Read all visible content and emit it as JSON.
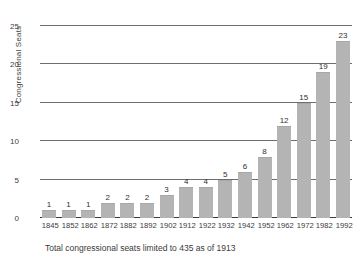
{
  "chart_data": {
    "type": "bar",
    "title": "",
    "subtitle": "",
    "xlabel": "",
    "ylabel": "Congressional Seats",
    "categories": [
      "1845",
      "1852",
      "1862",
      "1872",
      "1882",
      "1892",
      "1902",
      "1912",
      "1922",
      "1932",
      "1942",
      "1952",
      "1962",
      "1972",
      "1982",
      "1992"
    ],
    "values": [
      1,
      1,
      1,
      2,
      2,
      2,
      3,
      4,
      4,
      5,
      6,
      8,
      12,
      15,
      19,
      23
    ],
    "ylim": [
      0,
      25
    ],
    "y_ticks": [
      0,
      5,
      10,
      15,
      20,
      25
    ],
    "y_tick_labels": [
      "0",
      "5",
      "10",
      "15",
      "20",
      "25"
    ],
    "grid": true,
    "legend": null,
    "annotations": [
      "Total congressional seats limited to 435 as of 1913"
    ],
    "bar_color": "#b4b4b4",
    "show_value_labels": true
  },
  "caption": "Total congressional seats limited to 435 as of 1913",
  "colors": {
    "background": "#ffffff",
    "bar": "#b4b4b4",
    "gridline": "#6e6e6e",
    "axis": "#3c3c3c",
    "text": "#3d3d3d"
  }
}
